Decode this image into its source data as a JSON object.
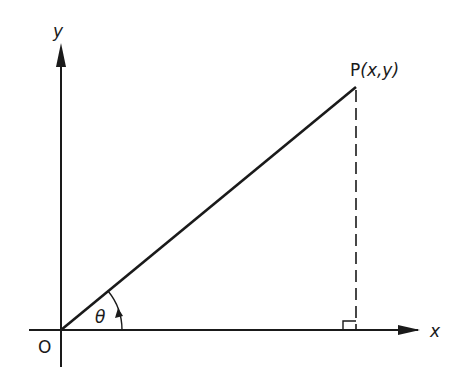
{
  "diagram": {
    "title": "",
    "axes": {
      "x_label": "x",
      "y_label": "y",
      "origin_label": "O"
    },
    "point": {
      "label": "P(x,y)",
      "name": "P",
      "coords": "(x,y)"
    },
    "angle": {
      "label": "θ"
    },
    "colors": {
      "stroke": "#1a1a1a",
      "background": "#ffffff"
    }
  }
}
